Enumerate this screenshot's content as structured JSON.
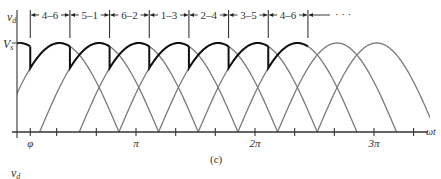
{
  "figure": {
    "caption": "(c)",
    "lower_axis_label": "v_d"
  },
  "chart_data": {
    "type": "line",
    "title": "",
    "ylabel": "v_d",
    "xlabel": "ωt",
    "y_tick_label": "V_s",
    "x_ticks": [
      {
        "label": "φ",
        "value_rad": 0.35
      },
      {
        "label": "",
        "value_rad": 1.047
      },
      {
        "label": "",
        "value_rad": 2.094
      },
      {
        "label": "π",
        "value_rad": 3.1416
      },
      {
        "label": "",
        "value_rad": 4.189
      },
      {
        "label": "",
        "value_rad": 5.236
      },
      {
        "label": "2π",
        "value_rad": 6.2832
      },
      {
        "label": "",
        "value_rad": 7.33
      },
      {
        "label": "",
        "value_rad": 8.378
      },
      {
        "label": "3π",
        "value_rad": 9.4248
      },
      {
        "label": "",
        "value_rad": 10.47
      }
    ],
    "xlim_rad": [
      0,
      11.2
    ],
    "ylim": [
      0,
      1.15
    ],
    "amplitude_label": "V_s",
    "waveform": "half-wave sine humps, amplitude V_s, phase-shifted by π/3",
    "hump_phase_shift_rad": 1.0472,
    "hump_start_offsets_rad": [
      -0.45,
      0.597,
      1.644,
      2.691,
      3.738,
      4.785,
      5.832,
      6.879,
      7.926
    ],
    "firing_angle_label": "φ",
    "firing_angle_rad": 0.35,
    "conduction_intervals": [
      "4–6",
      "5–1",
      "6–2",
      "1–3",
      "2–4",
      "3–5",
      "4–6"
    ],
    "interval_continuation": "· · ·",
    "output_trace": "bold envelope following each hump for π/3 after firing, then jumping to the next hump"
  }
}
